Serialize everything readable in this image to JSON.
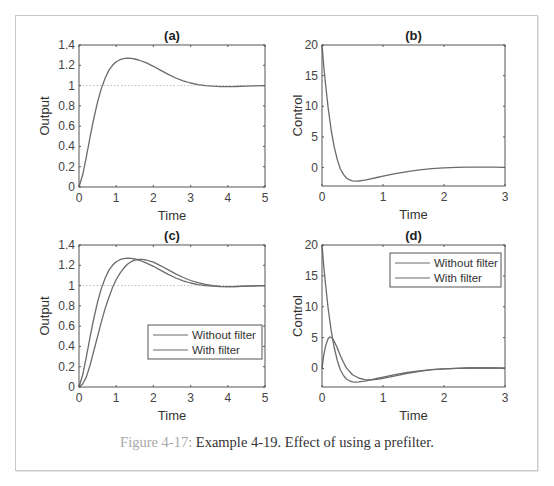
{
  "caption": {
    "label": "Figure 4-17:",
    "text": " Example 4-19. Effect of using a prefilter."
  },
  "colors": {
    "line": "#6b6b6b",
    "axes": "#555555",
    "ref_line": "#c0c0c0",
    "caption_label": "#a8a8a8"
  },
  "chart_data": [
    {
      "id": "a",
      "type": "line",
      "title": "(a)",
      "xlabel": "Time",
      "ylabel": "Output",
      "xlim": [
        0,
        5
      ],
      "ylim": [
        0,
        1.4
      ],
      "xticks": [
        0,
        1,
        2,
        3,
        4,
        5
      ],
      "yticks": [
        0,
        0.2,
        0.4,
        0.6,
        0.8,
        1,
        1.2,
        1.4
      ],
      "ytick_labels": [
        "0",
        "0.2",
        "0.4",
        "0.6",
        "0.8",
        "1",
        "1.2",
        "1.4"
      ],
      "ref_line": 1,
      "grid": false,
      "series": [
        {
          "name": "Output",
          "x": [
            0,
            0.1,
            0.2,
            0.3,
            0.4,
            0.5,
            0.6,
            0.7,
            0.8,
            0.9,
            1.0,
            1.1,
            1.2,
            1.3,
            1.4,
            1.5,
            1.6,
            1.8,
            2.0,
            2.2,
            2.4,
            2.6,
            2.8,
            3.0,
            3.2,
            3.4,
            3.6,
            3.8,
            4.0,
            4.2,
            4.5,
            5.0
          ],
          "y": [
            0,
            0.12,
            0.3,
            0.5,
            0.68,
            0.84,
            0.97,
            1.07,
            1.15,
            1.2,
            1.235,
            1.255,
            1.265,
            1.27,
            1.268,
            1.262,
            1.252,
            1.225,
            1.19,
            1.15,
            1.11,
            1.075,
            1.047,
            1.025,
            1.01,
            1.0,
            0.994,
            0.99,
            0.99,
            0.991,
            0.995,
            1.0
          ]
        }
      ]
    },
    {
      "id": "b",
      "type": "line",
      "title": "(b)",
      "xlabel": "Time",
      "ylabel": "Control",
      "xlim": [
        0,
        3
      ],
      "ylim": [
        -3,
        20
      ],
      "xticks": [
        0,
        1,
        2,
        3
      ],
      "yticks": [
        0,
        5,
        10,
        15,
        20
      ],
      "ytick_labels": [
        "0",
        "5",
        "10",
        "15",
        "20"
      ],
      "grid": false,
      "series": [
        {
          "name": "Control",
          "x": [
            0,
            0.03,
            0.06,
            0.1,
            0.15,
            0.2,
            0.25,
            0.3,
            0.35,
            0.4,
            0.45,
            0.5,
            0.55,
            0.6,
            0.7,
            0.8,
            0.9,
            1.0,
            1.2,
            1.4,
            1.6,
            1.8,
            2.0,
            2.2,
            2.4,
            2.6,
            2.8,
            3.0
          ],
          "y": [
            20,
            16.5,
            13.4,
            9.8,
            6.2,
            3.4,
            1.3,
            -0.2,
            -1.1,
            -1.7,
            -2.0,
            -2.15,
            -2.2,
            -2.18,
            -2.05,
            -1.85,
            -1.62,
            -1.4,
            -1.0,
            -0.65,
            -0.38,
            -0.18,
            -0.05,
            0.03,
            0.07,
            0.08,
            0.07,
            0.05
          ]
        }
      ]
    },
    {
      "id": "c",
      "type": "line",
      "title": "(c)",
      "xlabel": "Time",
      "ylabel": "Output",
      "xlim": [
        0,
        5
      ],
      "ylim": [
        0,
        1.4
      ],
      "xticks": [
        0,
        1,
        2,
        3,
        4,
        5
      ],
      "yticks": [
        0,
        0.2,
        0.4,
        0.6,
        0.8,
        1,
        1.2,
        1.4
      ],
      "ytick_labels": [
        "0",
        "0.2",
        "0.4",
        "0.6",
        "0.8",
        "1",
        "1.2",
        "1.4"
      ],
      "ref_line": 1,
      "grid": false,
      "legend": {
        "position": "lower right",
        "entries": [
          "Without filter",
          "With filter"
        ]
      },
      "series": [
        {
          "name": "Without filter",
          "x": [
            0,
            0.1,
            0.2,
            0.3,
            0.4,
            0.5,
            0.6,
            0.7,
            0.8,
            0.9,
            1.0,
            1.1,
            1.2,
            1.3,
            1.4,
            1.5,
            1.6,
            1.8,
            2.0,
            2.2,
            2.4,
            2.6,
            2.8,
            3.0,
            3.2,
            3.4,
            3.6,
            3.8,
            4.0,
            4.2,
            4.5,
            5.0
          ],
          "y": [
            0,
            0.12,
            0.3,
            0.5,
            0.68,
            0.84,
            0.97,
            1.07,
            1.15,
            1.2,
            1.235,
            1.255,
            1.265,
            1.27,
            1.268,
            1.262,
            1.252,
            1.225,
            1.19,
            1.15,
            1.11,
            1.075,
            1.047,
            1.025,
            1.01,
            1.0,
            0.994,
            0.99,
            0.99,
            0.991,
            0.995,
            1.0
          ]
        },
        {
          "name": "With filter",
          "x": [
            0,
            0.1,
            0.2,
            0.3,
            0.4,
            0.5,
            0.6,
            0.7,
            0.8,
            0.9,
            1.0,
            1.1,
            1.2,
            1.3,
            1.4,
            1.5,
            1.6,
            1.7,
            1.8,
            2.0,
            2.2,
            2.4,
            2.6,
            2.8,
            3.0,
            3.2,
            3.4,
            3.6,
            3.8,
            4.0,
            4.2,
            4.5,
            5.0
          ],
          "y": [
            0,
            0.03,
            0.1,
            0.22,
            0.36,
            0.5,
            0.64,
            0.77,
            0.88,
            0.98,
            1.06,
            1.12,
            1.17,
            1.21,
            1.235,
            1.25,
            1.258,
            1.258,
            1.252,
            1.23,
            1.195,
            1.155,
            1.115,
            1.08,
            1.05,
            1.028,
            1.012,
            1.0,
            0.993,
            0.99,
            0.99,
            0.994,
            1.0
          ]
        }
      ]
    },
    {
      "id": "d",
      "type": "line",
      "title": "(d)",
      "xlabel": "Time",
      "ylabel": "Control",
      "xlim": [
        0,
        3
      ],
      "ylim": [
        -3,
        20
      ],
      "xticks": [
        0,
        1,
        2,
        3
      ],
      "yticks": [
        0,
        5,
        10,
        15,
        20
      ],
      "ytick_labels": [
        "0",
        "5",
        "10",
        "15",
        "20"
      ],
      "grid": false,
      "legend": {
        "position": "upper right",
        "entries": [
          "Without filter",
          "With filter"
        ]
      },
      "series": [
        {
          "name": "Without filter",
          "x": [
            0,
            0.03,
            0.06,
            0.1,
            0.15,
            0.2,
            0.25,
            0.3,
            0.35,
            0.4,
            0.45,
            0.5,
            0.55,
            0.6,
            0.7,
            0.8,
            0.9,
            1.0,
            1.2,
            1.4,
            1.6,
            1.8,
            2.0,
            2.2,
            2.4,
            2.6,
            2.8,
            3.0
          ],
          "y": [
            20,
            16.5,
            13.4,
            9.8,
            6.2,
            3.4,
            1.3,
            -0.2,
            -1.1,
            -1.7,
            -2.0,
            -2.15,
            -2.2,
            -2.18,
            -2.05,
            -1.85,
            -1.62,
            -1.4,
            -1.0,
            -0.65,
            -0.38,
            -0.18,
            -0.05,
            0.03,
            0.07,
            0.08,
            0.07,
            0.05
          ]
        },
        {
          "name": "With filter",
          "x": [
            0,
            0.03,
            0.06,
            0.1,
            0.13,
            0.16,
            0.2,
            0.25,
            0.3,
            0.35,
            0.4,
            0.5,
            0.6,
            0.7,
            0.8,
            0.9,
            1.0,
            1.2,
            1.4,
            1.6,
            1.8,
            2.0,
            2.2,
            2.4,
            2.6,
            2.8,
            3.0
          ],
          "y": [
            0,
            2.2,
            3.7,
            4.8,
            5.1,
            5.0,
            4.4,
            3.3,
            2.1,
            1.0,
            0.1,
            -1.0,
            -1.55,
            -1.8,
            -1.85,
            -1.75,
            -1.6,
            -1.2,
            -0.8,
            -0.45,
            -0.2,
            -0.05,
            0.03,
            0.07,
            0.08,
            0.07,
            0.05
          ]
        }
      ]
    }
  ],
  "layout": {
    "panels": {
      "a": {
        "left": 79,
        "top": 45,
        "right": 265,
        "bottom": 187
      },
      "b": {
        "left": 322,
        "top": 45,
        "right": 505,
        "bottom": 186
      },
      "c": {
        "left": 79,
        "top": 245,
        "right": 265,
        "bottom": 387
      },
      "d": {
        "left": 322,
        "top": 245,
        "right": 505,
        "bottom": 387
      }
    },
    "legends": {
      "c": {
        "left": 148,
        "top": 325,
        "width": 114,
        "height": 34
      },
      "d": {
        "left": 390,
        "top": 253,
        "width": 111,
        "height": 34
      }
    }
  }
}
